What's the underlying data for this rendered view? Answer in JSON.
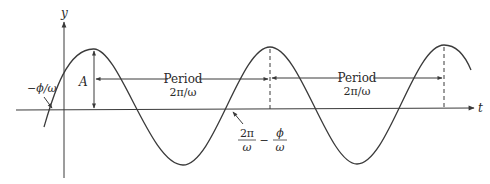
{
  "diagram": {
    "type": "sinusoid-annotation",
    "colors": {
      "stroke": "#3a3a3a",
      "background": "#ffffff"
    },
    "axes": {
      "x_label": "t",
      "y_label": "y"
    },
    "labels": {
      "amplitude": "A",
      "phase_offset": "−ϕ/ω",
      "period_1_title": "Period",
      "period_1_value": "2π/ω",
      "period_2_title": "Period",
      "period_2_value": "2π/ω",
      "crossing_num_1": "2π",
      "crossing_den_1": "ω",
      "crossing_minus": "−",
      "crossing_num_2": "ϕ",
      "crossing_den_2": "ω"
    },
    "curve": {
      "function": "y = A cos(ωt + ϕ)",
      "peaks_px": [
        [
          94,
          49
        ],
        [
          270,
          47
        ],
        [
          444,
          45
        ]
      ],
      "troughs_px": [
        [
          183,
          165
        ],
        [
          357,
          164
        ]
      ],
      "zero_crossings_px": [
        52,
        232,
        403
      ]
    }
  }
}
